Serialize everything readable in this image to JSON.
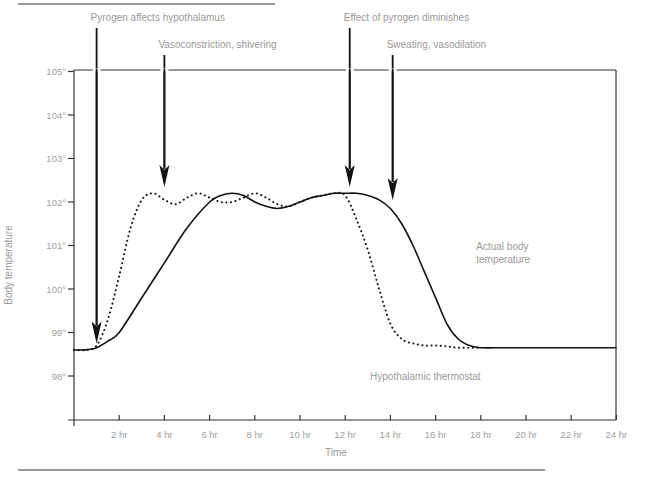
{
  "chart_data": {
    "type": "line",
    "title": "",
    "xlabel": "Time",
    "ylabel": "Body temperature",
    "xlim": [
      0,
      24
    ],
    "ylim": [
      97.5,
      105
    ],
    "x_ticks": [
      2,
      4,
      6,
      8,
      10,
      12,
      14,
      16,
      18,
      20,
      22,
      24
    ],
    "x_tick_labels": [
      "2 hr",
      "4 hr",
      "6 hr",
      "8 hr",
      "10 hr",
      "12 hr",
      "14 hr",
      "16 hr",
      "18 hr",
      "20 hr",
      "22 hr",
      "24 hr"
    ],
    "y_ticks": [
      98,
      99,
      100,
      101,
      102,
      103,
      104,
      105
    ],
    "y_tick_labels": [
      "98°",
      "99°",
      "100°",
      "101°",
      "102°",
      "103°",
      "104°",
      "105°"
    ],
    "grid": false,
    "series": [
      {
        "name": "Actual body temperature",
        "style": "solid",
        "x": [
          0,
          0.5,
          1,
          1.5,
          2,
          3,
          4,
          5,
          6,
          6.5,
          7,
          7.5,
          8,
          8.5,
          9,
          9.5,
          10,
          10.5,
          11,
          11.5,
          12,
          12.5,
          13,
          13.5,
          14,
          14.5,
          15,
          15.5,
          16,
          16.5,
          17,
          17.5,
          18,
          19,
          20,
          21,
          22,
          23,
          24
        ],
        "y": [
          98.6,
          98.6,
          98.65,
          98.8,
          99.0,
          99.8,
          100.6,
          101.4,
          102.0,
          102.15,
          102.2,
          102.15,
          102.0,
          101.9,
          101.85,
          101.9,
          102.0,
          102.1,
          102.15,
          102.2,
          102.2,
          102.2,
          102.15,
          102.05,
          101.85,
          101.5,
          101.0,
          100.4,
          99.8,
          99.2,
          98.85,
          98.7,
          98.65,
          98.65,
          98.65,
          98.65,
          98.65,
          98.65,
          98.65
        ]
      },
      {
        "name": "Hypothalamic thermostat",
        "style": "dotted",
        "x": [
          0,
          0.5,
          1,
          1.5,
          2,
          2.5,
          3,
          3.5,
          4,
          4.5,
          5,
          5.5,
          6,
          6.5,
          7,
          7.5,
          8,
          8.5,
          9,
          9.5,
          10,
          10.5,
          11,
          11.5,
          12,
          12.5,
          13,
          13.5,
          14,
          14.5,
          15,
          15.5,
          16,
          16.5,
          17,
          17.5,
          18
        ],
        "y": [
          98.6,
          98.6,
          98.7,
          99.3,
          100.3,
          101.4,
          102.05,
          102.2,
          102.05,
          101.95,
          102.1,
          102.2,
          102.1,
          102.0,
          102.0,
          102.1,
          102.2,
          102.1,
          101.95,
          101.9,
          102.0,
          102.1,
          102.15,
          102.2,
          102.15,
          101.6,
          100.9,
          100.0,
          99.2,
          98.85,
          98.75,
          98.7,
          98.7,
          98.68,
          98.65,
          98.65,
          98.65
        ]
      }
    ],
    "annotations": [
      {
        "text": "Pyrogen affects hypothalamus",
        "x": 1,
        "arrow_to_y": 98.7
      },
      {
        "text": "Vasoconstriction, shivering",
        "x": 4,
        "arrow_to_y": 102.3
      },
      {
        "text": "Effect of pyrogen diminishes",
        "x": 12.2,
        "arrow_to_y": 102.3
      },
      {
        "text": "Sweating, vasodilation",
        "x": 14.1,
        "arrow_to_y": 102.0
      }
    ],
    "series_labels": [
      {
        "text_lines": [
          "Actual body",
          "temperature"
        ],
        "x": 17.8,
        "y": 100.9
      },
      {
        "text_lines": [
          "Hypothalamic thermostat"
        ],
        "x": 13.1,
        "y": 97.9
      }
    ],
    "legend": "none"
  }
}
